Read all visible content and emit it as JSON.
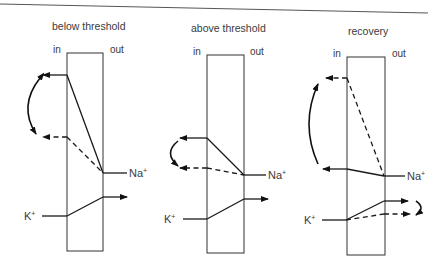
{
  "diagram": {
    "top_rule": true,
    "panels": [
      {
        "title": "below threshold",
        "in_label": "in",
        "out_label": "out",
        "na_label": "Na",
        "na_sup": "+",
        "k_label": "K",
        "k_sup": "+",
        "description": "Na+ enters (solid line to upper inward arrow); dashed lower inward arrow; bidirectional curved arrow between the two inward states. K+ crosses outward (solid)."
      },
      {
        "title": "above threshold",
        "in_label": "in",
        "out_label": "out",
        "na_label": "Na",
        "na_sup": "+",
        "k_label": "K",
        "k_sup": "+",
        "description": "Na+ enters (solid to upper arrow, dashed to lower arrow); curved arrow downward from solid to dashed state. K+ crosses outward (solid)."
      },
      {
        "title": "recovery",
        "in_label": "in",
        "out_label": "out",
        "na_label": "Na",
        "na_sup": "+",
        "k_label": "K",
        "k_sup": "+",
        "description": "Na+ upper path now dashed, lower path solid; curved arrow upward. K+ has solid and dashed outward paths with a small curved arrow from solid to dashed."
      }
    ],
    "colors": {
      "line": "#1a1a1a",
      "text": "#3a3a3a",
      "background": "#ffffff"
    }
  }
}
